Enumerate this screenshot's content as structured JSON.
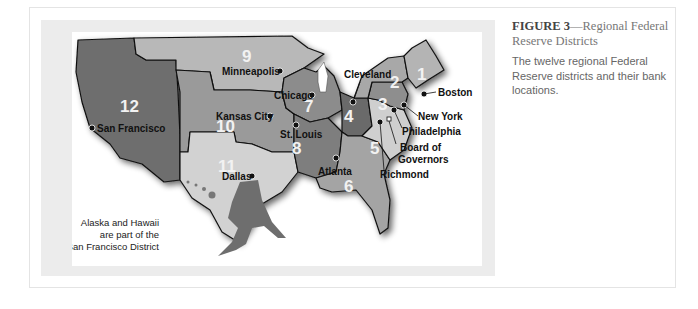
{
  "figure": {
    "label": "FIGURE 3",
    "title": "—Regional Federal Reserve Districts",
    "description": "The twelve regional Federal Reserve districts and their bank locations."
  },
  "map": {
    "districts": [
      {
        "number": "1",
        "city": "Boston",
        "color": "#b4b4b4"
      },
      {
        "number": "2",
        "city": "New York",
        "color": "#a8a8a8"
      },
      {
        "number": "3",
        "city": "Philadelphia",
        "color": "#8e8e8e"
      },
      {
        "number": "4",
        "city": "Cleveland",
        "color": "#6a6a6a"
      },
      {
        "number": "5",
        "city": "Richmond",
        "color": "#cfcfcf"
      },
      {
        "number": "6",
        "city": "Atlanta",
        "color": "#a4a4a4"
      },
      {
        "number": "7",
        "city": "Chicago",
        "color": "#8c8c8c"
      },
      {
        "number": "8",
        "city": "St. Louis",
        "color": "#7e7e7e"
      },
      {
        "number": "9",
        "city": "Minneapolis",
        "color": "#b8b8b8"
      },
      {
        "number": "10",
        "city": "Kansas City",
        "color": "#9a9a9a"
      },
      {
        "number": "11",
        "city": "Dallas",
        "color": "#d2d2d2"
      },
      {
        "number": "12",
        "city": "San Francisco",
        "color": "#6e6e6e"
      }
    ],
    "board_label_1": "Board of",
    "board_label_2": "Governors",
    "note_line1": "Alaska and Hawaii",
    "note_line2": "are part of the",
    "note_line3": "San Francisco District"
  }
}
